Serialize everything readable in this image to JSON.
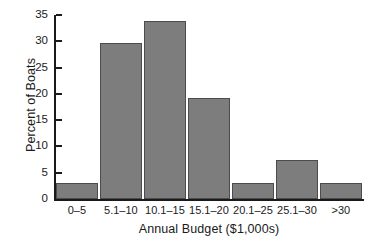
{
  "chart_data": {
    "type": "bar",
    "title": "",
    "xlabel": "Annual Budget ($1,000s)",
    "ylabel": "Percent of Boats",
    "categories": [
      "0–5",
      "5.1–10",
      "10.1–15",
      "15.1–20",
      "20.1–25",
      "25.1–30",
      ">30"
    ],
    "values": [
      3.0,
      29.6,
      33.8,
      19.2,
      3.0,
      7.4,
      3.0
    ],
    "ylim": [
      0,
      35
    ],
    "yticks": [
      0,
      5,
      10,
      15,
      20,
      25,
      30,
      35
    ],
    "ytick_labels": [
      "0",
      "5",
      "10",
      "15",
      "20",
      "25",
      "30",
      "35"
    ],
    "grid": false,
    "legend": null,
    "bar_fill_color": "#7d7d7d",
    "bar_edge_color": "#4c4c4c",
    "axis_color": "#1a1a1a",
    "background_color": "#ffffff"
  }
}
